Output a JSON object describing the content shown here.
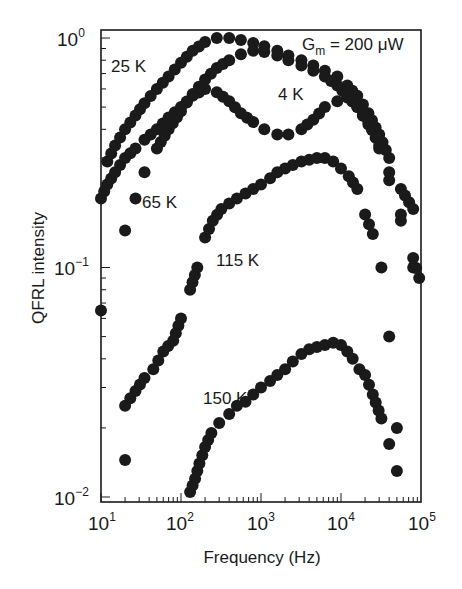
{
  "chart_data": {
    "type": "scatter",
    "title": "",
    "xlabel": "Frequency (Hz)",
    "ylabel": "QFRL intensity",
    "xscale": "log",
    "yscale": "log",
    "xlim": [
      10,
      100000
    ],
    "ylim": [
      0.01,
      1.15
    ],
    "grid": false,
    "legend": "none (inline curve labels)",
    "x_ticks": [
      "10^1",
      "10^2",
      "10^3",
      "10^4",
      "10^5"
    ],
    "y_ticks": [
      "10^-2",
      "10^-1",
      "10^0"
    ],
    "annotation": "G_m = 200 μW",
    "series": [
      {
        "name": "4 K",
        "label": "4 K",
        "x": [
          10,
          12,
          15,
          20,
          27,
          35,
          50,
          70,
          100,
          140,
          200,
          280,
          400,
          560,
          800,
          1100,
          1600,
          2200,
          3200,
          4500,
          6300,
          9000,
          12000,
          16000,
          22000,
          30000,
          40000,
          56000,
          80000
        ],
        "y": [
          0.2,
          0.23,
          0.26,
          0.3,
          0.33,
          0.36,
          0.4,
          0.45,
          0.5,
          0.56,
          0.6,
          0.58,
          0.53,
          0.47,
          0.43,
          0.4,
          0.38,
          0.38,
          0.4,
          0.44,
          0.5,
          0.53,
          0.55,
          0.5,
          0.42,
          0.33,
          0.24,
          0.16,
          0.1
        ]
      },
      {
        "name": "25 K",
        "label": "25 K",
        "x": [
          12,
          15,
          20,
          27,
          35,
          50,
          70,
          100,
          140,
          200,
          280,
          400,
          560,
          800,
          1100,
          1600,
          2200,
          3200,
          4500,
          6300,
          9000,
          12000,
          16000,
          22000,
          30000,
          40000,
          56000,
          80000
        ],
        "y": [
          0.29,
          0.34,
          0.4,
          0.46,
          0.52,
          0.6,
          0.68,
          0.78,
          0.88,
          0.96,
          1.0,
          1.0,
          0.98,
          0.95,
          0.92,
          0.88,
          0.84,
          0.8,
          0.76,
          0.72,
          0.68,
          0.62,
          0.56,
          0.47,
          0.38,
          0.3,
          0.22,
          0.18
        ]
      },
      {
        "name": "65 K",
        "label": "65 K",
        "x": [
          20,
          27,
          35,
          50,
          70,
          100,
          140,
          200,
          280,
          400,
          560,
          800,
          1100,
          1600,
          2200,
          3200,
          4500,
          6300,
          9000,
          12000,
          16000,
          22000,
          30000,
          40000,
          56000,
          80000,
          95000
        ],
        "y": [
          0.145,
          0.2,
          0.26,
          0.33,
          0.4,
          0.48,
          0.57,
          0.66,
          0.74,
          0.8,
          0.85,
          0.88,
          0.87,
          0.84,
          0.8,
          0.76,
          0.72,
          0.68,
          0.62,
          0.56,
          0.5,
          0.43,
          0.34,
          0.26,
          0.17,
          0.11,
          0.09
        ]
      },
      {
        "name": "115 K",
        "label": "115 K",
        "x": [
          10,
          20,
          27,
          35,
          45,
          60,
          80,
          100,
          130,
          160,
          200,
          250,
          320,
          400,
          500,
          640,
          800,
          1000,
          1300,
          1600,
          2000,
          2500,
          3200,
          4000,
          5000,
          6300,
          8000,
          10000,
          12500,
          16000,
          20000,
          25000,
          32000,
          40000,
          50000
        ],
        "y": [
          0.065,
          0.025,
          0.029,
          0.033,
          0.036,
          0.043,
          0.048,
          0.06,
          0.08,
          0.1,
          0.135,
          0.16,
          0.18,
          0.19,
          0.2,
          0.21,
          0.22,
          0.23,
          0.245,
          0.26,
          0.27,
          0.28,
          0.29,
          0.295,
          0.3,
          0.3,
          0.29,
          0.27,
          0.25,
          0.22,
          0.17,
          0.14,
          0.1,
          0.05,
          0.02
        ]
      },
      {
        "name": "150 K",
        "label": "150 K",
        "x": [
          20,
          130,
          150,
          170,
          200,
          240,
          300,
          400,
          500,
          640,
          800,
          1000,
          1300,
          1600,
          2000,
          2500,
          3200,
          4000,
          5000,
          6300,
          8000,
          10000,
          12000,
          14000,
          17000,
          20000,
          25000,
          32000,
          40000,
          50000
        ],
        "y": [
          0.0145,
          0.0105,
          0.012,
          0.014,
          0.0165,
          0.019,
          0.021,
          0.023,
          0.025,
          0.026,
          0.028,
          0.03,
          0.032,
          0.034,
          0.036,
          0.039,
          0.042,
          0.044,
          0.045,
          0.046,
          0.047,
          0.046,
          0.043,
          0.04,
          0.036,
          0.034,
          0.028,
          0.022,
          0.017,
          0.013
        ]
      }
    ]
  },
  "labels": {
    "x_axis_title": "Frequency (Hz)",
    "y_axis_title": "QFRL intensity",
    "annotation_base": "G",
    "annotation_sub": "m",
    "annotation_rest": " = 200 μW",
    "series_4k": "4 K",
    "series_25k": "25 K",
    "series_65k": "65 K",
    "series_115k": "115 K",
    "series_150k": "150 K",
    "x_tick_base": "10",
    "x_tick_exps": [
      "1",
      "2",
      "3",
      "4",
      "5"
    ],
    "y_tick_base": "10",
    "y_tick_exps": [
      "−2",
      "−1",
      "0"
    ]
  },
  "colors": {
    "marker": "#1a1a1a",
    "axis": "#1a1a1a",
    "background": "#ffffff"
  }
}
